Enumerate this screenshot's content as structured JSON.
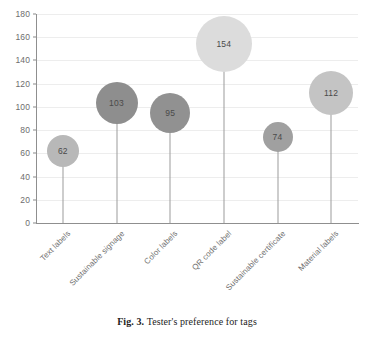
{
  "caption": {
    "figure_number": "Fig. 3.",
    "text": "Tester's preference for tags"
  },
  "chart_data": {
    "type": "bar",
    "subtype": "bubble-lollipop",
    "title": "",
    "xlabel": "",
    "ylabel": "",
    "ylim": [
      0,
      180
    ],
    "ytick_step": 20,
    "yticks": [
      "0",
      "20",
      "40",
      "60",
      "80",
      "100",
      "120",
      "140",
      "160",
      "180"
    ],
    "grid": true,
    "legend": "none",
    "xtick_rotation": -45,
    "categories": [
      "Text labels",
      "Sustainable signage",
      "Color labels",
      "QR code label",
      "Sustainable certificate",
      "Material labels"
    ],
    "values": [
      62,
      103,
      95,
      154,
      74,
      112
    ],
    "point_labels": [
      "62",
      "103",
      "95",
      "154",
      "74",
      "112"
    ],
    "bubble_diameters_px": [
      32,
      42,
      40,
      56,
      30,
      44
    ],
    "bubble_colors": [
      "#b8b8b8",
      "#8e8e8e",
      "#919191",
      "#dcdcdc",
      "#a0a0a0",
      "#c4c4c4"
    ],
    "stem_color": "#9b9b9b",
    "axis_color": "#8f8f8f",
    "grid_color": "#ededed",
    "label_color": "#6d6d6d",
    "background": "#ffffff"
  }
}
